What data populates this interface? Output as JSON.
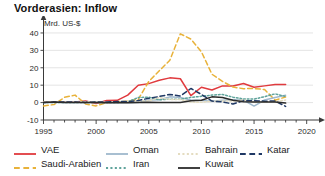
{
  "chart_data": {
    "type": "line",
    "title": "Vorderasien: Inflow",
    "ylabel": "Mrd. US-$",
    "xlabel": "",
    "xlim": [
      1995,
      2020.6
    ],
    "ylim": [
      -10,
      44
    ],
    "yticks": [
      -10,
      0,
      10,
      20,
      30,
      40
    ],
    "ytick_labels": [
      "-10",
      "0",
      "10",
      "20",
      "30",
      "40"
    ],
    "xticks": [
      1995,
      2000,
      2005,
      2010,
      2015,
      2020
    ],
    "xtick_labels": [
      "1995",
      "2000",
      "2005",
      "2010",
      "2015",
      "2020"
    ],
    "x_minor_tick_step": 1,
    "grid": "horizontal",
    "legend_position": "bottom",
    "x": [
      1995,
      1996,
      1997,
      1998,
      1999,
      2000,
      2001,
      2002,
      2003,
      2004,
      2005,
      2006,
      2007,
      2008,
      2009,
      2010,
      2011,
      2012,
      2013,
      2014,
      2015,
      2016,
      2017,
      2018
    ],
    "series": [
      {
        "name": "VAE",
        "color": "#e03a3e",
        "style": "solid",
        "values": [
          0.4,
          0.3,
          0.2,
          0.3,
          0.9,
          -0.5,
          1.2,
          1.3,
          4.3,
          10.0,
          10.9,
          12.8,
          14.2,
          13.7,
          4.0,
          8.8,
          7.2,
          9.6,
          9.5,
          11.0,
          8.8,
          9.6,
          10.4,
          10.4
        ],
        "note": "Solid red; rises steeply 2002-2007 to ~14, drops to ~4 in 2009, recovers to ~10-11, final upswing to ~14"
      },
      {
        "name": "Saudi-Arabien",
        "color": "#e8b23a",
        "style": "dashed",
        "values": [
          -1.9,
          -1.1,
          3.0,
          4.3,
          -0.8,
          -1.9,
          0.0,
          0.5,
          0.8,
          1.9,
          12.1,
          18.3,
          24.3,
          39.5,
          36.5,
          29.2,
          16.3,
          12.2,
          8.9,
          8.0,
          8.1,
          7.5,
          1.4,
          3.2
        ],
        "note": "Orange long-dash; large 2008 peak ~39-40"
      },
      {
        "name": "Oman",
        "color": "#9fb8cc",
        "style": "solid",
        "values": [
          0.0,
          0.1,
          0.1,
          0.1,
          0.0,
          0.1,
          0.0,
          0.1,
          0.0,
          0.1,
          1.5,
          1.6,
          3.3,
          2.9,
          1.5,
          1.2,
          0.8,
          1.4,
          1.6,
          1.5,
          -2.0,
          1.5,
          2.9,
          4.2
        ],
        "note": "Light steel-blue solid, low amplitude"
      },
      {
        "name": "Iran",
        "color": "#5fa39b",
        "style": "dotted",
        "values": [
          0.0,
          0.0,
          0.0,
          0.0,
          0.0,
          0.0,
          0.0,
          0.0,
          0.5,
          2.9,
          3.1,
          1.6,
          2.0,
          1.9,
          3.0,
          3.6,
          4.3,
          4.7,
          3.1,
          2.1,
          2.0,
          3.4,
          5.0,
          3.5
        ],
        "note": "Teal dotted"
      },
      {
        "name": "Bahrain",
        "color": "#e4dcc0",
        "style": "dotted",
        "values": [
          0.4,
          0.5,
          0.3,
          0.2,
          0.5,
          0.4,
          0.1,
          0.2,
          0.5,
          0.9,
          1.0,
          2.9,
          1.8,
          1.8,
          0.3,
          0.2,
          0.8,
          0.9,
          0.9,
          1.5,
          0.1,
          0.2,
          0.5,
          1.5
        ],
        "note": "Very pale sand-coloured dotted"
      },
      {
        "name": "Katar",
        "color": "#1f3864",
        "style": "dashed",
        "values": [
          0.1,
          0.3,
          0.4,
          0.3,
          0.1,
          0.3,
          0.3,
          0.6,
          0.6,
          1.2,
          2.5,
          3.5,
          4.7,
          3.8,
          8.1,
          4.7,
          0.9,
          0.4,
          -0.8,
          1.0,
          1.1,
          0.8,
          0.9,
          -2.2
        ],
        "note": "Dark navy dashed"
      },
      {
        "name": "Kuwait",
        "color": "#2b2b2b",
        "style": "solid",
        "values": [
          0.0,
          0.3,
          0.0,
          0.1,
          0.1,
          0.0,
          -0.1,
          0.0,
          -0.1,
          0.0,
          0.2,
          0.1,
          0.1,
          0.0,
          1.1,
          1.3,
          3.3,
          2.9,
          1.4,
          0.5,
          0.3,
          0.4,
          0.3,
          -0.3
        ],
        "note": "Dark charcoal solid, hugs the zero line"
      }
    ]
  },
  "legend": {
    "rows": [
      [
        {
          "label": "VAE",
          "color": "#e03a3e",
          "style": "solid"
        },
        {
          "label": "Oman",
          "color": "#9fb8cc",
          "style": "solid"
        },
        {
          "label": "Bahrain",
          "color": "#e4dcc0",
          "style": "dotted"
        },
        {
          "label": "Katar",
          "color": "#1f3864",
          "style": "dashed"
        }
      ],
      [
        {
          "label": "Saudi-Arabien",
          "color": "#e8b23a",
          "style": "dashed"
        },
        {
          "label": "Iran",
          "color": "#5fa39b",
          "style": "dotted"
        },
        {
          "label": "Kuwait",
          "color": "#2b2b2b",
          "style": "solid"
        }
      ]
    ]
  },
  "axis": {
    "unit_label": "Mrd. US-$"
  }
}
